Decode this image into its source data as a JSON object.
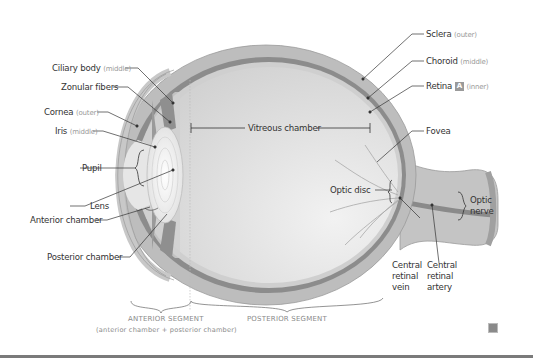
{
  "diagram": {
    "labels_left": [
      {
        "name": "Ciliary body",
        "qualifier": "(middle)"
      },
      {
        "name": "Zonular fibers",
        "qualifier": ""
      },
      {
        "name": "Cornea",
        "qualifier": "(outer)"
      },
      {
        "name": "Iris",
        "qualifier": "(middle)"
      },
      {
        "name": "Pupil",
        "qualifier": ""
      },
      {
        "name": "Lens",
        "qualifier": ""
      },
      {
        "name": "Anterior chamber",
        "qualifier": ""
      },
      {
        "name": "Posterior chamber",
        "qualifier": ""
      }
    ],
    "labels_right": [
      {
        "name": "Sclera",
        "qualifier": "(outer)"
      },
      {
        "name": "Choroid",
        "qualifier": "(middle)"
      },
      {
        "name": "Retina",
        "badge": "A",
        "qualifier": "(inner)"
      },
      {
        "name": "Fovea",
        "qualifier": ""
      }
    ],
    "center_label": "Vitreous chamber",
    "optic_disc": "Optic disc",
    "optic_nerve": "Optic nerve",
    "central_retinal_vein": "Central retinal vein",
    "central_retinal_artery": "Central retinal artery",
    "segments": {
      "anterior": "ANTERIOR SEGMENT",
      "anterior_note": "(anterior chamber + posterior chamber)",
      "posterior": "POSTERIOR SEGMENT"
    },
    "colors": {
      "sclera": "#bdbdbd",
      "choroid": "#8c8c8c",
      "retina": "#cfcfcf",
      "vitreous": "#dcdcdc",
      "lens": "#f4f4f4",
      "line": "#333333"
    }
  }
}
